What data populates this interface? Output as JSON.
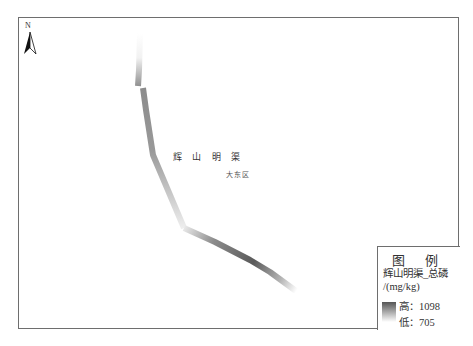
{
  "map": {
    "north_label": "N",
    "canal_label": "辉 山 明 渠",
    "district_label": "大东区"
  },
  "legend": {
    "title": "图 例",
    "field_line1": "辉山明渠_总磷",
    "field_line2": "/(mg/kg)",
    "high_label": "高：1098",
    "low_label": "低：705",
    "high_value": 1098,
    "low_value": 705,
    "ramp_high_color": "#555555",
    "ramp_low_color": "#ffffff"
  }
}
